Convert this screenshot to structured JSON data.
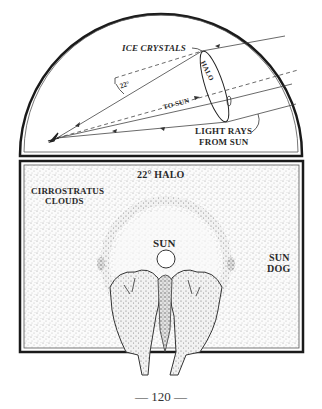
{
  "top_diagram": {
    "labels": {
      "ice_crystals": "ICE CRYSTALS",
      "halo": "HALO",
      "angle": "22°",
      "to_sun": "TO SUN",
      "light_rays_line1": "LIGHT RAYS",
      "light_rays_line2": "FROM SUN"
    }
  },
  "bottom_diagram": {
    "labels": {
      "halo_title": "22° HALO",
      "clouds_line1": "CIRROSTRATUS",
      "clouds_line2": "CLOUDS",
      "sun": "SUN",
      "sun_dog_line1": "SUN",
      "sun_dog_line2": "DOG"
    }
  },
  "page": {
    "number": "— 120 —"
  },
  "colors": {
    "ink": "#1a1a1a",
    "paper": "#ffffff",
    "stipple": "#9a9a9a"
  }
}
